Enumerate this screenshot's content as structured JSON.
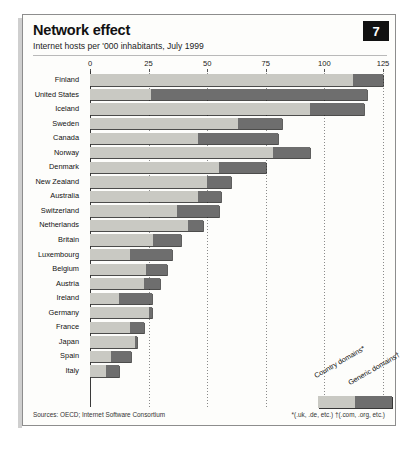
{
  "badge": "7",
  "source": "Sources: OECD; Internet Software Consortium",
  "footnote": "*(.uk, .de, etc.)  †(.com, .org, etc.)",
  "legend": {
    "country_label": "Country domains*",
    "generic_label": "Generic domains†"
  },
  "colors": {
    "country": "#c9c9c3",
    "generic": "#6e6e6e",
    "badge_bg": "#111111",
    "frame": "#8d8d8d"
  },
  "chart_data": {
    "type": "bar",
    "orientation": "horizontal",
    "stacked": true,
    "title": "Network effect",
    "subtitle": "Internet hosts per '000 inhabitants, July 1999",
    "xlabel": "",
    "ylabel": "",
    "xlim": [
      0,
      125
    ],
    "ticks": [
      0,
      25,
      50,
      75,
      100,
      125
    ],
    "grid": true,
    "legend_position": "bottom-right",
    "categories": [
      "Finland",
      "United States",
      "Iceland",
      "Sweden",
      "Canada",
      "Norway",
      "Denmark",
      "New Zealand",
      "Australia",
      "Switzerland",
      "Netherlands",
      "Britain",
      "Luxembourg",
      "Belgium",
      "Austria",
      "Ireland",
      "Germany",
      "France",
      "Japan",
      "Spain",
      "Italy"
    ],
    "series": [
      {
        "name": "Country domains*",
        "values": [
          112.0,
          26.0,
          94.0,
          63.0,
          46.0,
          78.0,
          55.0,
          50.0,
          46.0,
          37.0,
          42.0,
          27.0,
          17.0,
          24.0,
          23.0,
          12.5,
          25.0,
          17.0,
          19.0,
          9.0,
          7.0
        ]
      },
      {
        "name": "Generic domains†",
        "values": [
          13.0,
          92.0,
          23.0,
          19.0,
          34.0,
          16.0,
          20.0,
          10.0,
          10.0,
          18.0,
          6.0,
          12.0,
          18.0,
          9.0,
          7.0,
          14.0,
          1.5,
          6.0,
          1.0,
          8.5,
          5.5
        ]
      }
    ],
    "totals": [
      125.0,
      118.0,
      117.0,
      82.0,
      80.0,
      94.0,
      75.0,
      60.0,
      56.0,
      55.0,
      48.0,
      39.0,
      35.0,
      33.0,
      30.0,
      26.5,
      26.5,
      23.0,
      20.0,
      17.5,
      12.5
    ]
  }
}
